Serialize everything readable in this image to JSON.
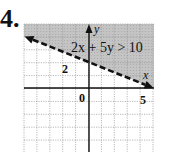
{
  "problem": {
    "number": "4."
  },
  "colors": {
    "shade": "#c8c8c8",
    "grid": "#9a9a9a",
    "axis": "#111111",
    "line": "#111111"
  },
  "chart_data": {
    "type": "line",
    "title": "2x + 5y > 10",
    "xlabel": "x",
    "ylabel": "y",
    "xlim": [
      -5,
      5
    ],
    "ylim": [
      -5,
      5
    ],
    "grid": true,
    "tick_labels": {
      "x": [
        "5"
      ],
      "y": [
        "2"
      ],
      "origin": "0"
    },
    "boundary": {
      "equation": "2x + 5y = 10",
      "style": "dashed",
      "points": [
        [
          -5,
          4
        ],
        [
          0,
          2
        ],
        [
          5,
          0
        ]
      ]
    },
    "shaded_region": "above boundary line (2x + 5y > 10)"
  }
}
